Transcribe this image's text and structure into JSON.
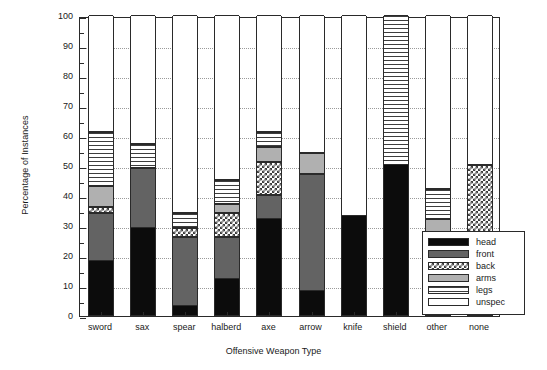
{
  "chart_data": {
    "type": "bar",
    "subtype": "stacked-bar-100",
    "title": "",
    "xlabel": "Offensive Weapon Type",
    "ylabel": "Percentage of Instances",
    "ylim": [
      0,
      100
    ],
    "ytick_labels": [
      "0",
      "10",
      "20",
      "30",
      "40",
      "50",
      "60",
      "70",
      "80",
      "90",
      "100"
    ],
    "ytick_values": [
      0,
      10,
      20,
      30,
      40,
      50,
      60,
      70,
      80,
      90,
      100
    ],
    "grid": "horizontal-dotted",
    "legend_position": "lower-right-inside",
    "categories": [
      "sword",
      "sax",
      "spear",
      "halberd",
      "axe",
      "arrow",
      "knife",
      "shield",
      "other",
      "none"
    ],
    "series": [
      {
        "name": "head",
        "color": "#0c0c0c",
        "pattern": "solid-black",
        "values": [
          18,
          29,
          3,
          12,
          32,
          8,
          33,
          50,
          17,
          20
        ]
      },
      {
        "name": "front",
        "color": "#636363",
        "pattern": "solid-dark-gray",
        "values": [
          16,
          20,
          23,
          14,
          8,
          39,
          0,
          0,
          4,
          2
        ]
      },
      {
        "name": "back",
        "color": "#3d3d3d",
        "pattern": "checkered",
        "values": [
          2,
          0,
          3,
          8,
          11,
          0,
          0,
          0,
          3,
          28
        ]
      },
      {
        "name": "arms",
        "color": "#b0b0b0",
        "pattern": "solid-light-gray",
        "values": [
          7,
          0,
          0,
          3,
          5,
          7,
          0,
          0,
          8,
          0
        ]
      },
      {
        "name": "legs",
        "color": "#3d3d3d",
        "pattern": "horizontal-lines",
        "values": [
          18,
          8,
          5,
          8,
          5,
          0,
          0,
          50,
          10,
          0
        ]
      },
      {
        "name": "unspec",
        "color": "#ffffff",
        "pattern": "empty-white",
        "values": [
          39,
          43,
          66,
          55,
          39,
          46,
          67,
          0,
          58,
          50
        ]
      }
    ]
  },
  "legend": {
    "entries": [
      {
        "label": "head"
      },
      {
        "label": "front"
      },
      {
        "label": "back"
      },
      {
        "label": "arms"
      },
      {
        "label": "legs"
      },
      {
        "label": "unspec"
      }
    ]
  }
}
